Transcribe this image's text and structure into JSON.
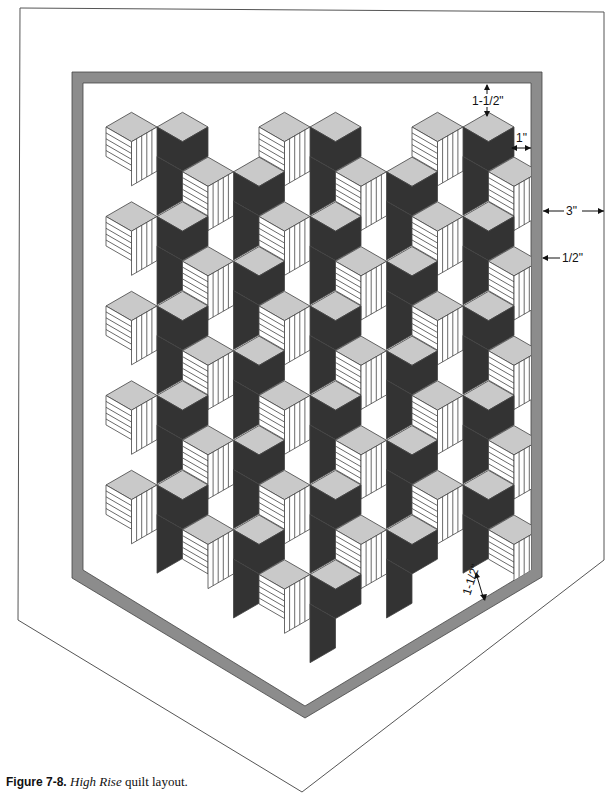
{
  "figure": {
    "number_label": "Figure 7-8.",
    "title_italic": "High Rise",
    "title_rest": " quilt layout."
  },
  "dimensions": {
    "top_inner_border": "1-1/2\"",
    "side_inner_border": "1\"",
    "outer_border": "3\"",
    "gray_border": "1/2\"",
    "bottom_inner_border": "1-1/2\""
  },
  "colors": {
    "light_face": "#c9c9c9",
    "dark_face": "#333333",
    "gray_band": "#8c8c8c",
    "line": "#444444",
    "background": "#ffffff"
  },
  "layout": {
    "outer_outline": [
      [
        20,
        8
      ],
      [
        604,
        12
      ],
      [
        604,
        560
      ],
      [
        302,
        792
      ],
      [
        18,
        620
      ]
    ],
    "gray_band_outer": [
      [
        72,
        72
      ],
      [
        542,
        72
      ],
      [
        542,
        577
      ],
      [
        305,
        718
      ],
      [
        72,
        578
      ]
    ],
    "gray_band_inner": [
      [
        83,
        83
      ],
      [
        531,
        83
      ],
      [
        531,
        570
      ],
      [
        305,
        706
      ],
      [
        83,
        570
      ]
    ],
    "lattice": {
      "w": 25.5,
      "h": 14.7,
      "col_spacing": 153,
      "row_spacing": 89.5,
      "origin_x": 157,
      "origin_y": 127
    }
  },
  "quilt": {
    "block_name": "High Rise",
    "rows": [
      {
        "row": 0,
        "x_offset": 0,
        "cols": [
          0,
          1,
          2
        ]
      },
      {
        "row": 1,
        "x_offset": 76.5,
        "cols": [
          0,
          1,
          2
        ]
      },
      {
        "row": 2,
        "x_offset": 0,
        "cols": [
          0,
          1,
          2
        ]
      },
      {
        "row": 3,
        "x_offset": 76.5,
        "cols": [
          0,
          1,
          2
        ]
      },
      {
        "row": 4,
        "x_offset": 0,
        "cols": [
          0,
          1,
          2
        ]
      },
      {
        "row": 5,
        "x_offset": 76.5,
        "cols": [
          0,
          1,
          2
        ]
      },
      {
        "row": 6,
        "x_offset": 0,
        "cols": [
          0,
          1,
          2
        ]
      },
      {
        "row": 7,
        "x_offset": 76.5,
        "cols": [
          0,
          1,
          2
        ]
      },
      {
        "row": 8,
        "x_offset": 0,
        "cols": [
          0,
          1,
          2
        ]
      },
      {
        "row": 9,
        "x_offset": 76.5,
        "cols": [
          0,
          1,
          2
        ]
      },
      {
        "row": 10,
        "x_offset": 0,
        "cols": [
          1
        ]
      }
    ]
  }
}
